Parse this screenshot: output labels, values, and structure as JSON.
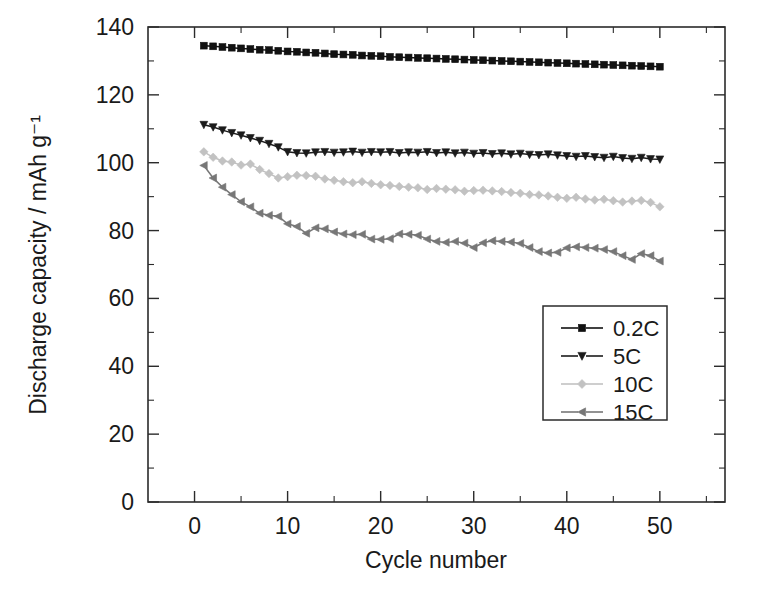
{
  "chart_data": {
    "type": "line",
    "title": "",
    "xlabel": "Cycle number",
    "ylabel": "Discharge capacity / mAh g⁻¹",
    "xlim": [
      -5,
      57
    ],
    "ylim": [
      0,
      140
    ],
    "xticks": [
      0,
      10,
      20,
      30,
      40,
      50
    ],
    "xticklabels": [
      "0",
      "10",
      "20",
      "30",
      "40",
      "50"
    ],
    "xticks_minor": [
      5,
      15,
      25,
      35,
      45,
      55
    ],
    "yticks": [
      0,
      20,
      40,
      60,
      80,
      100,
      120,
      140
    ],
    "yticklabels": [
      "0",
      "20",
      "40",
      "60",
      "80",
      "100",
      "120",
      "140"
    ],
    "yticks_minor": [
      10,
      30,
      50,
      70,
      90,
      110,
      130
    ],
    "grid": false,
    "legend_position": "lower right",
    "x": [
      1,
      2,
      3,
      4,
      5,
      6,
      7,
      8,
      9,
      10,
      11,
      12,
      13,
      14,
      15,
      16,
      17,
      18,
      19,
      20,
      21,
      22,
      23,
      24,
      25,
      26,
      27,
      28,
      29,
      30,
      31,
      32,
      33,
      34,
      35,
      36,
      37,
      38,
      39,
      40,
      41,
      42,
      43,
      44,
      45,
      46,
      47,
      48,
      49,
      50
    ],
    "series": [
      {
        "name": "0.2C",
        "marker": "square",
        "color": "#111111",
        "values": [
          134.5,
          134.3,
          134.1,
          133.9,
          133.7,
          133.5,
          133.3,
          133.2,
          133.0,
          132.8,
          132.7,
          132.5,
          132.4,
          132.2,
          132.0,
          131.9,
          131.8,
          131.6,
          131.5,
          131.4,
          131.2,
          131.1,
          131.0,
          130.9,
          130.8,
          130.7,
          130.6,
          130.5,
          130.4,
          130.3,
          130.2,
          130.1,
          130.0,
          129.9,
          129.8,
          129.7,
          129.6,
          129.5,
          129.4,
          129.3,
          129.2,
          129.1,
          129.0,
          128.9,
          128.8,
          128.7,
          128.6,
          128.5,
          128.4,
          128.3
        ]
      },
      {
        "name": "5C",
        "marker": "triangle-down",
        "color": "#1b1b1b",
        "values": [
          111.2,
          110.5,
          109.6,
          108.8,
          108.1,
          107.3,
          106.5,
          105.6,
          104.6,
          103.2,
          102.9,
          102.8,
          103.1,
          103.2,
          103.0,
          103.1,
          103.3,
          103.0,
          103.2,
          103.1,
          103.2,
          102.9,
          103.1,
          103.0,
          103.2,
          102.9,
          103.1,
          102.8,
          103.0,
          102.7,
          102.9,
          102.6,
          102.8,
          102.5,
          102.7,
          102.4,
          102.3,
          102.5,
          102.2,
          102.0,
          101.8,
          102.0,
          101.7,
          101.5,
          101.8,
          101.4,
          101.2,
          101.5,
          101.1,
          101.0
        ]
      },
      {
        "name": "10C",
        "marker": "diamond",
        "color": "#c2c2c2",
        "values": [
          103.2,
          101.6,
          100.5,
          100.2,
          99.3,
          99.6,
          98.0,
          96.8,
          95.5,
          95.9,
          96.3,
          96.2,
          96.0,
          95.2,
          94.8,
          94.4,
          94.1,
          94.4,
          93.9,
          93.5,
          93.3,
          93.0,
          92.8,
          92.6,
          92.1,
          92.4,
          92.2,
          92.0,
          91.6,
          91.8,
          91.9,
          91.7,
          91.5,
          91.2,
          91.0,
          90.6,
          90.5,
          90.2,
          89.8,
          89.5,
          89.8,
          89.3,
          89.0,
          89.2,
          88.8,
          88.4,
          88.7,
          88.9,
          88.3,
          87.0
        ]
      },
      {
        "name": "15C",
        "marker": "triangle-left",
        "color": "#777777",
        "values": [
          99.2,
          95.5,
          92.8,
          90.6,
          88.5,
          87.0,
          85.1,
          84.5,
          84.2,
          82.0,
          81.2,
          79.2,
          80.8,
          80.5,
          79.6,
          79.0,
          78.8,
          78.9,
          77.5,
          77.4,
          77.6,
          79.0,
          78.9,
          78.6,
          77.5,
          76.8,
          76.5,
          76.8,
          76.3,
          75.0,
          76.4,
          77.0,
          76.8,
          76.6,
          76.2,
          75.0,
          73.8,
          73.4,
          73.6,
          74.9,
          75.2,
          75.0,
          74.8,
          74.4,
          73.8,
          72.6,
          71.5,
          73.2,
          72.6,
          71.0
        ]
      }
    ]
  },
  "legend": {
    "items": [
      {
        "label": "0.2C"
      },
      {
        "label": "5C"
      },
      {
        "label": "10C"
      },
      {
        "label": "15C"
      }
    ]
  }
}
